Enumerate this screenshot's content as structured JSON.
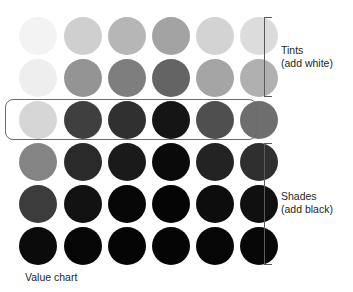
{
  "chart_data": {
    "type": "table",
    "title": "Value chart",
    "xlabel": "",
    "ylabel": "",
    "columns": [
      "column-1",
      "column-2",
      "column-3",
      "column-4",
      "column-5",
      "column-6"
    ],
    "row_names": [
      "tint-2",
      "tint-1",
      "hue",
      "shade-1",
      "shade-2",
      "shade-3"
    ],
    "row_values": [
      {
        "name": "tint-2",
        "group": "tints",
        "lightness_pct": 92
      },
      {
        "name": "tint-1",
        "group": "tints",
        "lightness_pct": 78
      },
      {
        "name": "hue",
        "group": "hue",
        "lightness_pct": 55
      },
      {
        "name": "shade-1",
        "group": "shades",
        "lightness_pct": 35
      },
      {
        "name": "shade-2",
        "group": "shades",
        "lightness_pct": 18
      },
      {
        "name": "shade-3",
        "group": "shades",
        "lightness_pct": 5
      }
    ],
    "swatch_colors": [
      [
        "#f3f3f3",
        "#cfcfcf",
        "#b6b6b6",
        "#a3a3a3",
        "#d3d3d3",
        "#dcdcdc"
      ],
      [
        "#eeeeee",
        "#949494",
        "#7e7e7e",
        "#646464",
        "#a5a5a5",
        "#b0b0b0"
      ],
      [
        "#d6d6d6",
        "#3f3f3f",
        "#303030",
        "#151515",
        "#4f4f4f",
        "#6e6e6e"
      ],
      [
        "#848484",
        "#2a2a2a",
        "#1a1a1a",
        "#0a0a0a",
        "#232323",
        "#2f2f2f"
      ],
      [
        "#3c3c3c",
        "#121212",
        "#070707",
        "#050505",
        "#0d0d0d",
        "#101010"
      ],
      [
        "#0b0b0b",
        "#060606",
        "#050505",
        "#050505",
        "#060606",
        "#070707"
      ]
    ]
  },
  "annotations": {
    "tints": {
      "title": "Tints",
      "subtitle": "(add white)"
    },
    "shades": {
      "title": "Shades",
      "subtitle": "(add black)"
    },
    "caption": "Value chart"
  },
  "layout": {
    "column_x": [
      19,
      64,
      108,
      152,
      196,
      240
    ],
    "row_y": [
      17,
      59,
      101,
      143,
      185,
      227
    ],
    "swatch_diameter": 38,
    "highlight_row_index": 2
  },
  "colors": {
    "background": "#ffffff",
    "text": "#231f20",
    "bracket_stroke": "#5a5a5a",
    "highlight_stroke": "#6b6b6b"
  }
}
